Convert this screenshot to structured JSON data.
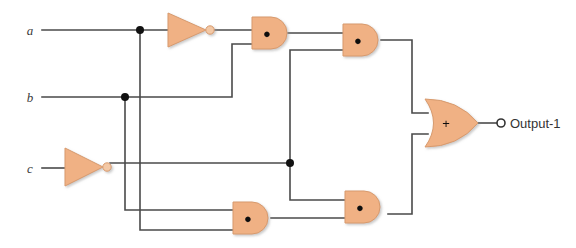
{
  "diagram": {
    "background": "#ffffff",
    "wire_color": "#4a4a4a",
    "gate_fill": "#f0b184",
    "gate_stroke": "#c98a5e",
    "junction_color": "#111111",
    "bubble_fill": "#f3c8a5"
  },
  "inputs": [
    {
      "id": "a",
      "label": "a",
      "x": 30,
      "y": 30
    },
    {
      "id": "b",
      "label": "b",
      "x": 30,
      "y": 97
    },
    {
      "id": "c",
      "label": "c",
      "x": 30,
      "y": 168
    }
  ],
  "output": {
    "id": "out1",
    "label": "Output-1",
    "terminal_x": 501,
    "terminal_y": 123
  },
  "gates": [
    {
      "id": "not-a",
      "type": "NOT",
      "symbol": "",
      "x": 168,
      "y": 30,
      "name": "not-gate-a"
    },
    {
      "id": "not-c",
      "type": "NOT",
      "symbol": "",
      "x": 65,
      "y": 168,
      "name": "not-gate-c"
    },
    {
      "id": "and-1",
      "type": "AND",
      "symbol": "●",
      "x": 252,
      "y": 33,
      "name": "and-gate-1"
    },
    {
      "id": "and-2",
      "type": "AND",
      "symbol": "●",
      "x": 343,
      "y": 40,
      "name": "and-gate-2"
    },
    {
      "id": "and-3",
      "type": "AND",
      "symbol": "●",
      "x": 233,
      "y": 218,
      "name": "and-gate-3"
    },
    {
      "id": "and-4",
      "type": "AND",
      "symbol": "●",
      "x": 345,
      "y": 207,
      "name": "and-gate-4"
    },
    {
      "id": "or-1",
      "type": "OR",
      "symbol": "+",
      "x": 425,
      "y": 123,
      "name": "or-gate-1"
    }
  ],
  "junctions": [
    {
      "id": "j-a",
      "x": 140,
      "y": 30
    },
    {
      "id": "j-b",
      "x": 125,
      "y": 97
    },
    {
      "id": "j-notc",
      "x": 290,
      "y": 163
    }
  ],
  "symbols": {
    "and": "●",
    "or": "+"
  }
}
